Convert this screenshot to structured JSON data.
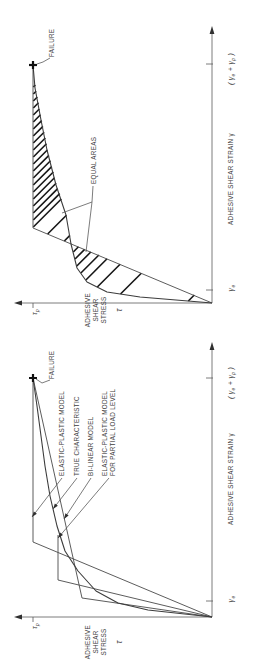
{
  "figure": {
    "background": "#ffffff",
    "line_color": "#5a5a5a",
    "curve_color": "#3c3c3c",
    "hatch_color": "#161616",
    "text_color": "#3d3d3d"
  },
  "panels": [
    {
      "id": "equal-areas-panel",
      "stress_axis": {
        "label_lines": [
          "ADHESIVE",
          "SHEAR",
          "STRESS"
        ],
        "symbol": "τ",
        "peak_label": "τ_p"
      },
      "strain_axis": {
        "label": "ADHESIVE SHEAR STRAIN  γ",
        "elastic_label": "γ_e",
        "failure_label": "( γ_e + γ_p )"
      },
      "annotations": {
        "failure": "FAILURE",
        "equal_areas": "EQUAL AREAS"
      },
      "geom": {
        "w": 334,
        "h": 258,
        "origin": [
          31,
          212
        ],
        "stress_top": 21,
        "strain_end": 301,
        "tau_tick_y": 33,
        "gamma_e_x": 44,
        "gamma_f_x": 270,
        "model": [
          [
            31,
            212
          ],
          [
            106,
            33
          ],
          [
            269,
            33
          ]
        ],
        "true_curve": [
          [
            31,
            212
          ],
          [
            37,
            140
          ],
          [
            42,
            107
          ],
          [
            52,
            87
          ],
          [
            66,
            77
          ],
          [
            90,
            71
          ],
          [
            119,
            66
          ],
          [
            149,
            56
          ],
          [
            184,
            47
          ],
          [
            214,
            41
          ],
          [
            246,
            35
          ],
          [
            269,
            33
          ]
        ],
        "elastic_line": {
          "x0": 31,
          "x1": 106,
          "y0": 212,
          "y1": 33
        },
        "failure_point": [
          269,
          33
        ],
        "failure_label_pos": [
          277,
          54
        ],
        "failure_leader": [
          [
            276,
            50
          ],
          [
            272,
            43
          ],
          [
            270,
            37
          ]
        ],
        "equal_label_pos": [
          150,
          96
        ],
        "equal_leaders": [
          [
            [
              148,
              93
            ],
            [
              132,
              92
            ],
            [
              121,
              62
            ]
          ],
          [
            [
              132,
              92
            ],
            [
              82,
              86
            ]
          ]
        ],
        "hatch": {
          "band1": [
            33,
            90
          ],
          "band2": [
            93,
            264
          ],
          "spacing": 7
        },
        "stress_label_x": 24,
        "stress_label_rows": [
          90,
          98,
          106
        ],
        "tau_symbol_y": 122,
        "strain_label_cx": 155,
        "axis_label_row_y": 232
      }
    },
    {
      "id": "models-panel",
      "stress_axis": {
        "label_lines": [
          "ADHESIVE",
          "SHEAR",
          "STRESS"
        ],
        "symbol": "τ",
        "peak_label": "τ_p"
      },
      "strain_axis": {
        "label": "ADHESIVE SHEAR STRAIN  γ",
        "elastic_label": "γ_e",
        "failure_label": "( γ_e + γ_p )"
      },
      "annotations": {
        "failure": "FAILURE"
      },
      "legend": [
        {
          "lines": [
            "ELASTIC-PLASTIC MODEL"
          ],
          "rows": [
            62
          ],
          "tip": [
            150,
            32
          ]
        },
        {
          "lines": [
            "TRUE CHARACTERISTIC"
          ],
          "rows": [
            77
          ],
          "tip": [
            158,
            53
          ]
        },
        {
          "lines": [
            "BI-LINEAR MODEL"
          ],
          "rows": [
            91
          ],
          "tip": [
            148,
            64
          ]
        },
        {
          "lines": [
            "ELASTIC-PLASTIC MODEL",
            "FOR PARTIAL LOAD LEVEL"
          ],
          "rows": [
            105,
            113
          ],
          "tip": [
            129,
            58
          ]
        }
      ],
      "geom": {
        "w": 334,
        "h": 258,
        "origin": [
          50,
          212
        ],
        "stress_top": 21,
        "strain_end": 318,
        "tau_tick_y": 33,
        "gamma_e_x": 66,
        "gamma_f_x": 289,
        "curves": {
          "true_characteristic": [
            [
              50,
              212
            ],
            [
              57,
              148
            ],
            [
              64,
              118
            ],
            [
              76,
              96
            ],
            [
              96,
              78
            ],
            [
              116,
              65
            ],
            [
              141,
              57
            ],
            [
              171,
              50
            ],
            [
              201,
              45
            ],
            [
              231,
              41
            ],
            [
              261,
              37
            ],
            [
              289,
              33
            ]
          ],
          "elastic_plastic": [
            [
              50,
              212
            ],
            [
              125,
              33
            ],
            [
              289,
              33
            ]
          ],
          "bilinear": [
            [
              50,
              212
            ],
            [
              69,
              82
            ],
            [
              289,
              33
            ]
          ],
          "partial_load": [
            [
              50,
              212
            ],
            [
              87,
              58
            ],
            [
              132,
              58
            ]
          ]
        },
        "failure_point": [
          289,
          33
        ],
        "failure_label_pos": [
          288,
          54
        ],
        "failure_leader": [
          [
            287,
            50
          ],
          [
            284,
            42
          ],
          [
            288,
            36
          ]
        ],
        "legend_x": 191,
        "stress_label_x": 25,
        "stress_label_rows": [
          90,
          98,
          106
        ],
        "tau_symbol_y": 122,
        "strain_label_cx": 188,
        "axis_label_row_y": 232
      }
    }
  ],
  "chart_data": [
    {
      "type": "line",
      "title": "",
      "xlabel": "ADHESIVE SHEAR STRAIN γ",
      "ylabel": "ADHESIVE SHEAR STRESS τ",
      "x_ticks": [
        "γe",
        "(γe + γp)"
      ],
      "x_tick_positions_normalized": [
        0.055,
        1.0
      ],
      "y_ticks": [
        "τp"
      ],
      "y_tick_positions_normalized": [
        1.0
      ],
      "xlim_normalized": [
        0,
        1
      ],
      "ylim_normalized": [
        0,
        1
      ],
      "grid": false,
      "annotations": [
        "FAILURE at strain (γe+γp), stress τp",
        "EQUAL AREAS between true characteristic and elastic-plastic model (hatched)"
      ],
      "series": [
        {
          "name": "TRUE CHARACTERISTIC",
          "x": [
            0,
            0.025,
            0.046,
            0.088,
            0.147,
            0.248,
            0.37,
            0.496,
            0.643,
            0.769,
            0.903,
            1.0
          ],
          "y": [
            0,
            0.402,
            0.587,
            0.698,
            0.754,
            0.788,
            0.816,
            0.872,
            0.922,
            0.955,
            0.989,
            1.0
          ]
        },
        {
          "name": "ELASTIC-PLASTIC MODEL (equal-area construction)",
          "x": [
            0,
            0.315,
            1.0
          ],
          "y": [
            0,
            1.0,
            1.0
          ]
        }
      ]
    },
    {
      "type": "line",
      "title": "",
      "xlabel": "ADHESIVE SHEAR STRAIN γ",
      "ylabel": "ADHESIVE SHEAR STRESS τ",
      "x_ticks": [
        "γe",
        "(γe + γp)"
      ],
      "x_tick_positions_normalized": [
        0.067,
        1.0
      ],
      "y_ticks": [
        "τp"
      ],
      "y_tick_positions_normalized": [
        1.0
      ],
      "xlim_normalized": [
        0,
        1
      ],
      "ylim_normalized": [
        0,
        1
      ],
      "grid": false,
      "annotations": [
        "FAILURE at strain (γe+γp), stress τp"
      ],
      "series": [
        {
          "name": "TRUE CHARACTERISTIC",
          "x": [
            0,
            0.029,
            0.059,
            0.109,
            0.192,
            0.276,
            0.381,
            0.506,
            0.632,
            0.757,
            0.883,
            1.0
          ],
          "y": [
            0,
            0.358,
            0.525,
            0.648,
            0.749,
            0.821,
            0.866,
            0.905,
            0.933,
            0.955,
            0.978,
            1.0
          ]
        },
        {
          "name": "ELASTIC-PLASTIC MODEL",
          "x": [
            0,
            0.314,
            1.0
          ],
          "y": [
            0,
            1.0,
            1.0
          ]
        },
        {
          "name": "BI-LINEAR MODEL",
          "x": [
            0,
            0.079,
            1.0
          ],
          "y": [
            0,
            0.726,
            1.0
          ]
        },
        {
          "name": "ELASTIC-PLASTIC MODEL FOR PARTIAL LOAD LEVEL",
          "x": [
            0,
            0.155,
            0.343
          ],
          "y": [
            0,
            0.86,
            0.86
          ]
        }
      ]
    }
  ]
}
